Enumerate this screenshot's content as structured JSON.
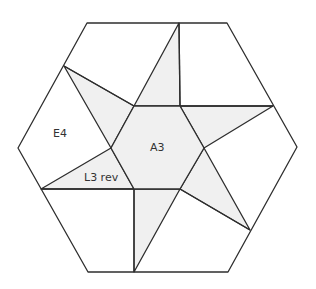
{
  "diagram": {
    "type": "hexagon-star-quilt-block",
    "colors": {
      "line": "#2e2e2e",
      "shaded_fill": "#f0f0f0",
      "background": "#ffffff"
    },
    "labels": {
      "center": "A3",
      "left_piece": "E4",
      "star_point": "L3 rev"
    }
  }
}
